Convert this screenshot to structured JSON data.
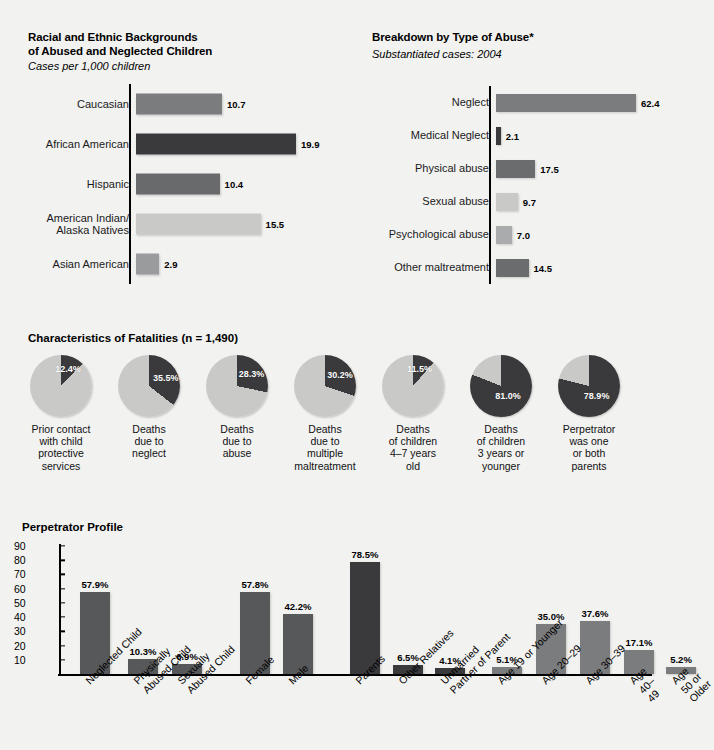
{
  "meta": {
    "background": "#f2f2f1",
    "palette": {
      "dark": "#3a3a3c",
      "mid_dark": "#595a5c",
      "mid": "#7b7c7e",
      "light": "#c9cac8",
      "pie_light": "#c9cac8",
      "pie_dark": "#3a3a3c"
    }
  },
  "top_clipped_text": "",
  "chart_data": [
    {
      "id": "race",
      "type": "bar",
      "orientation": "horizontal",
      "title_line1": "Racial and Ethnic Backgrounds",
      "title_line2": "of Abused and Neglected Children",
      "subtitle": "Cases per 1,000 children",
      "xlabel": "",
      "ylabel": "",
      "xlim": [
        0,
        19.9
      ],
      "grid": false,
      "categories": [
        "Caucasian",
        "African American",
        "Hispanic",
        "American Indian/\nAlaska Natives",
        "Asian American"
      ],
      "values": [
        10.7,
        19.9,
        10.4,
        15.5,
        2.9
      ],
      "value_labels": [
        "10.7",
        "19.9",
        "10.4",
        "15.5",
        "2.9"
      ],
      "colors": [
        "#7b7c7e",
        "#3a3a3c",
        "#686a6c",
        "#c9cac8",
        "#9a9b9c"
      ]
    },
    {
      "id": "abuse_type",
      "type": "bar",
      "orientation": "horizontal",
      "title_line1": "Breakdown by Type of Abuse*",
      "title_line2": "",
      "subtitle": "Substantiated cases: 2004",
      "xlabel": "",
      "ylabel": "",
      "xlim": [
        0,
        62.4
      ],
      "grid": false,
      "categories": [
        "Neglect",
        "Medical Neglect",
        "Physical abuse",
        "Sexual abuse",
        "Psychological abuse",
        "Other maltreatment"
      ],
      "values": [
        62.4,
        2.1,
        17.5,
        9.7,
        7.0,
        14.5
      ],
      "value_labels": [
        "62.4",
        "2.1",
        "17.5",
        "9.7",
        "7.0",
        "14.5"
      ],
      "colors": [
        "#7b7c7e",
        "#3a3a3c",
        "#6b6c6e",
        "#c9cac8",
        "#aaabac",
        "#6b6c6e"
      ]
    },
    {
      "id": "fatalities",
      "type": "pie",
      "title": "Characteristics of Fatalities (n = 1,490)",
      "slices": [
        {
          "caption": "Prior contact\nwith child\nprotective\nservices",
          "value": 12.4,
          "label": "12.4%"
        },
        {
          "caption": "Deaths\ndue to\nneglect",
          "value": 35.5,
          "label": "35.5%"
        },
        {
          "caption": "Deaths\ndue to\nabuse",
          "value": 28.3,
          "label": "28.3%"
        },
        {
          "caption": "Deaths\ndue to\nmultiple\nmaltreatment",
          "value": 30.2,
          "label": "30.2%"
        },
        {
          "caption": "Deaths\nof children\n4–7 years\nold",
          "value": 11.5,
          "label": "11.5%"
        },
        {
          "caption": "Deaths\nof children\n3 years or\nyounger",
          "value": 81.0,
          "label": "81.0%"
        },
        {
          "caption": "Perpetrator\nwas one\nor both\nparents",
          "value": 78.9,
          "label": "78.9%"
        }
      ]
    },
    {
      "id": "perpetrator",
      "type": "bar",
      "orientation": "vertical",
      "title": "Perpetrator Profile",
      "ylim": [
        0,
        90
      ],
      "yticks": [
        90,
        80,
        70,
        60,
        50,
        40,
        30,
        20,
        10
      ],
      "ylabel": "",
      "xlabel": "",
      "grid": false,
      "categories": [
        "Neglected Child",
        "Physically\nAbused Child",
        "Sexually\nAbused Child",
        "Female",
        "Male",
        "Parents",
        "Other Relatives",
        "Unmarried\nPartner of Parent",
        "Age 19 or Younger",
        "Age 20–29",
        "Age 30–39",
        "Age 40–49",
        "Age 50 or Older"
      ],
      "values": [
        57.9,
        10.3,
        6.9,
        57.8,
        42.2,
        78.5,
        6.5,
        4.1,
        5.1,
        35.0,
        37.6,
        17.1,
        5.2
      ],
      "value_labels": [
        "57.9%",
        "10.3%",
        "6.9%",
        "57.8%",
        "42.2%",
        "78.5%",
        "6.5%",
        "4.1%",
        "5.1%",
        "35.0%",
        "37.6%",
        "17.1%",
        "5.2%"
      ],
      "colors": [
        "#56585a",
        "#56585a",
        "#56585a",
        "#56585a",
        "#56585a",
        "#3a3a3c",
        "#3a3a3c",
        "#3a3a3c",
        "#7b7c7e",
        "#7b7c7e",
        "#7b7c7e",
        "#7b7c7e",
        "#7b7c7e"
      ]
    }
  ]
}
